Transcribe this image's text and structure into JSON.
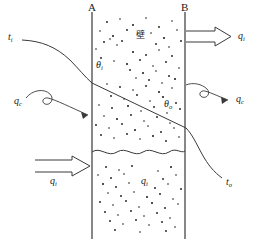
{
  "figure": {
    "title_caption": "",
    "background_color": "#ffffff",
    "line_color": "#3a3a3a",
    "stipple_color": "#1a1a1a",
    "wall_labels": {
      "left": "A",
      "right": "B"
    },
    "wall_annotation": {
      "text": "壁",
      "meaning": "wall"
    },
    "temperature_labels": {
      "inner_fluid": {
        "base": "t",
        "sub": "i"
      },
      "outer_fluid": {
        "base": "t",
        "sub": "o"
      }
    },
    "surface_temperature_labels": {
      "inner_surface": {
        "base": "θ",
        "sub": "i"
      },
      "outer_surface": {
        "base": "θ",
        "sub": "o"
      }
    },
    "heat_flux_labels": {
      "outflow_top": {
        "base": "q",
        "sub": "i"
      },
      "convection_right": {
        "base": "q",
        "sub": "c"
      },
      "convection_left": {
        "base": "q",
        "sub": "c"
      },
      "inflow_bottom": {
        "base": "q",
        "sub": "i"
      },
      "interior_bottom": {
        "base": "q",
        "sub": "i"
      }
    },
    "elements": {
      "wall_a_name": "wall-line-a",
      "wall_b_name": "wall-line-b",
      "wavy_divider_name": "wavy-interface-line",
      "gradient_line_name": "temperature-gradient-line"
    }
  }
}
